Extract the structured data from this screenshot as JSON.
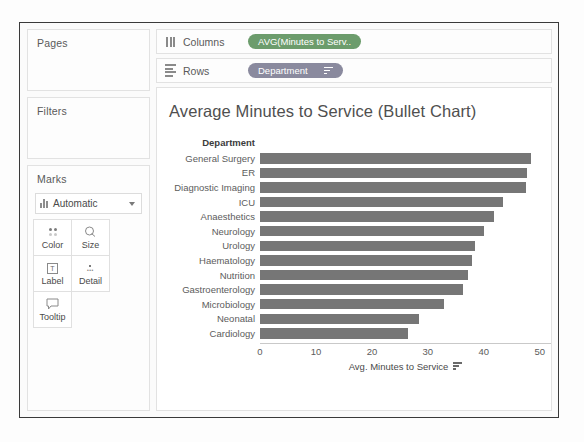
{
  "sidebar": {
    "pages_label": "Pages",
    "filters_label": "Filters",
    "marks_label": "Marks",
    "marks_type": "Automatic",
    "marks_type_icon": "bar-chart-icon",
    "marks_dropdown_icon": "chevron-down-icon",
    "buttons": [
      {
        "label": "Color",
        "icon": "color-dots-icon"
      },
      {
        "label": "Size",
        "icon": "size-circle-icon"
      },
      {
        "label": "Label",
        "icon": "label-text-icon"
      },
      {
        "label": "Detail",
        "icon": "detail-dots-icon"
      },
      {
        "label": "Tooltip",
        "icon": "tooltip-bubble-icon"
      }
    ]
  },
  "shelves": {
    "columns": {
      "name": "Columns",
      "icon": "columns-icon",
      "pill": {
        "text": "AVG(Minutes to Serv..",
        "color": "#6c9c6c",
        "has_sort": false
      }
    },
    "rows": {
      "name": "Rows",
      "icon": "rows-icon",
      "pill": {
        "text": "Department",
        "color": "#8a8a9e",
        "has_sort": true,
        "sort_icon": "sort-descending-icon"
      }
    }
  },
  "chart_data": {
    "type": "bar",
    "title": "Average Minutes to Service (Bullet Chart)",
    "orientation": "horizontal",
    "header_label": "Department",
    "categories": [
      "General Surgery",
      "ER",
      "Diagnostic Imaging",
      "ICU",
      "Anaesthetics",
      "Neurology",
      "Urology",
      "Haematology",
      "Nutrition",
      "Gastroenterology",
      "Microbiology",
      "Neonatal",
      "Cardiology"
    ],
    "values": [
      48.5,
      47.8,
      47.5,
      43.5,
      41.8,
      40.0,
      38.5,
      37.8,
      37.2,
      36.3,
      32.8,
      28.5,
      26.5
    ],
    "xlabel": "Avg. Minutes to Service",
    "ylabel": "Department",
    "xticks": [
      0,
      10,
      20,
      30,
      40,
      50
    ],
    "xlim": [
      0,
      52
    ],
    "grid": false,
    "legend": false,
    "bar_color": "#767676",
    "xlabel_sort_icon": "sort-descending-icon"
  }
}
